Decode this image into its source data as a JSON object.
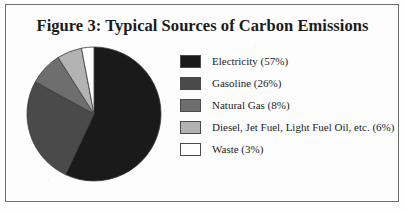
{
  "figure": {
    "title": "Figure 3: Typical Sources of Carbon Emissions",
    "frame_border_color": "#6d6d6d",
    "background_color": "#fdfdfd"
  },
  "chart_data": {
    "type": "pie",
    "title": "Figure 3: Typical Sources of Carbon Emissions",
    "xlabel": "",
    "ylabel": "",
    "unit": "%",
    "start_angle_deg": 0,
    "direction": "clockwise",
    "legend_position": "right",
    "grid": false,
    "categories": [
      "Electricity",
      "Gasoline",
      "Natural Gas",
      "Diesel, Jet Fuel, Light Fuel Oil, etc.",
      "Waste"
    ],
    "values": [
      57,
      26,
      8,
      6,
      3
    ],
    "colors": [
      "#1a1a1a",
      "#4a4a4a",
      "#6e6e6e",
      "#b3b3b3",
      "#ffffff"
    ],
    "slice_border_color": "#3a3a3a"
  },
  "legend": {
    "items": [
      {
        "label": "Electricity (57%)",
        "swatch_color": "#1a1a1a",
        "name": "legend-item-electricity"
      },
      {
        "label": "Gasoline (26%)",
        "swatch_color": "#4a4a4a",
        "name": "legend-item-gasoline"
      },
      {
        "label": "Natural Gas (8%)",
        "swatch_color": "#6e6e6e",
        "name": "legend-item-natural-gas"
      },
      {
        "label": "Diesel, Jet Fuel, Light Fuel Oil, etc. (6%)",
        "swatch_color": "#b3b3b3",
        "name": "legend-item-diesel"
      },
      {
        "label": "Waste (3%)",
        "swatch_color": "#ffffff",
        "name": "legend-item-waste"
      }
    ]
  }
}
